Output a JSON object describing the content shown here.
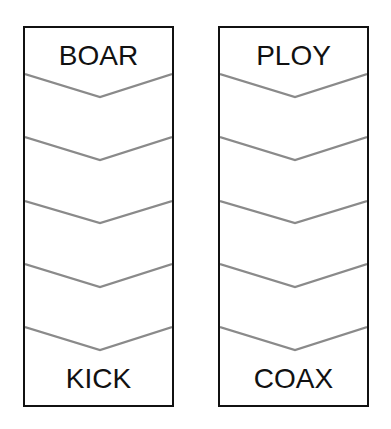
{
  "ladders": [
    {
      "start_word": "BOAR",
      "end_word": "KICK",
      "blank_rungs": 4
    },
    {
      "start_word": "PLOY",
      "end_word": "COAX",
      "blank_rungs": 4
    }
  ],
  "colors": {
    "border": "#111111",
    "chevron": "#8a8a8a",
    "text": "#111111"
  }
}
